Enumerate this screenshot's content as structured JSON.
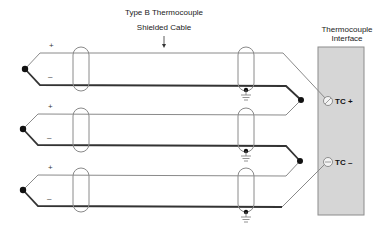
{
  "title": "Type B Thermocouple",
  "cable_label": "Shielded Cable",
  "interface": {
    "title_line1": "Thermocouple",
    "title_line2": "Interface",
    "fill": "#d6d6d6",
    "border": "#8c8c8c",
    "terminals": [
      {
        "label": "TC +",
        "y": 101
      },
      {
        "label": "TC –",
        "y": 162
      }
    ]
  },
  "thermocouples": [
    {
      "plus": "+",
      "minus": "–",
      "top_y": 53,
      "bottom_y": 85,
      "junction_y": 69
    },
    {
      "plus": "+",
      "minus": "–",
      "top_y": 114,
      "bottom_y": 145,
      "junction_y": 129
    },
    {
      "plus": "+",
      "minus": "–",
      "top_y": 175,
      "bottom_y": 206,
      "junction_y": 190
    }
  ],
  "colors": {
    "thin_wire": "#8a8a8a",
    "thick_wire": "#333333",
    "junction": "#111111"
  }
}
